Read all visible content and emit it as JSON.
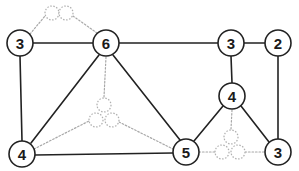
{
  "diagram": {
    "width": 299,
    "height": 171,
    "background_color": "#ffffff",
    "node_stroke_color": "#222222",
    "node_fill_color": "#ffffff",
    "label_color": "#1a1a1a",
    "solid_edge_color": "#222222",
    "dotted_edge_color": "#a8a8a8",
    "token_stroke_color": "#b0b0b0",
    "node_radius": 13,
    "token_radius": 7
  },
  "nodes": [
    {
      "id": "n-tl-3",
      "label": "3",
      "x": 20,
      "y": 43,
      "r": 13
    },
    {
      "id": "n-top-6",
      "label": "6",
      "x": 106,
      "y": 43,
      "r": 13
    },
    {
      "id": "n-tr-3",
      "label": "3",
      "x": 231,
      "y": 43,
      "r": 13
    },
    {
      "id": "n-tr-2",
      "label": "2",
      "x": 278,
      "y": 43,
      "r": 13
    },
    {
      "id": "n-mid-4",
      "label": "4",
      "x": 232,
      "y": 96,
      "r": 13
    },
    {
      "id": "n-bl-4",
      "label": "4",
      "x": 22,
      "y": 154,
      "r": 13
    },
    {
      "id": "n-bm-5",
      "label": "5",
      "x": 186,
      "y": 152,
      "r": 13
    },
    {
      "id": "n-br-3",
      "label": "3",
      "x": 278,
      "y": 152,
      "r": 13
    }
  ],
  "solid_edges": [
    {
      "name": "edge-3-6",
      "x1": 33,
      "y1": 43,
      "x2": 93,
      "y2": 43
    },
    {
      "name": "edge-6-3right",
      "x1": 119,
      "y1": 43,
      "x2": 218,
      "y2": 43
    },
    {
      "name": "edge-3right-2",
      "x1": 244,
      "y1": 43,
      "x2": 265,
      "y2": 43
    },
    {
      "name": "edge-3left-4left",
      "x1": 20,
      "y1": 56,
      "x2": 22,
      "y2": 141
    },
    {
      "name": "edge-2-3bottom",
      "x1": 278,
      "y1": 56,
      "x2": 278,
      "y2": 139
    },
    {
      "name": "edge-3right-4mid",
      "x1": 231,
      "y1": 56,
      "x2": 232,
      "y2": 83
    },
    {
      "name": "edge-6-4left",
      "x1": 99,
      "y1": 55,
      "x2": 31,
      "y2": 143
    },
    {
      "name": "edge-6-5",
      "x1": 113,
      "y1": 55,
      "x2": 180,
      "y2": 140
    },
    {
      "name": "edge-4left-5",
      "x1": 35,
      "y1": 155,
      "x2": 173,
      "y2": 153
    },
    {
      "name": "edge-4mid-5",
      "x1": 223,
      "y1": 106,
      "x2": 194,
      "y2": 141
    },
    {
      "name": "edge-4mid-3bottom",
      "x1": 241,
      "y1": 106,
      "x2": 269,
      "y2": 142
    }
  ],
  "dotted_edges": [
    {
      "name": "dotted-3left-token-a",
      "x1": 30,
      "y1": 34,
      "x2": 45,
      "y2": 16
    },
    {
      "name": "dotted-token-a-token-b",
      "x1": 59,
      "y1": 13,
      "x2": 59,
      "y2": 13
    },
    {
      "name": "dotted-token-b-6",
      "x1": 73,
      "y1": 16,
      "x2": 97,
      "y2": 33
    },
    {
      "name": "dotted-6-token-c",
      "x1": 106,
      "y1": 57,
      "x2": 104,
      "y2": 97
    },
    {
      "name": "dotted-4left-token-d",
      "x1": 34,
      "y1": 149,
      "x2": 89,
      "y2": 121
    },
    {
      "name": "dotted-token-e-5",
      "x1": 119,
      "y1": 122,
      "x2": 173,
      "y2": 149
    },
    {
      "name": "dotted-4mid-token-f",
      "x1": 232,
      "y1": 110,
      "x2": 231,
      "y2": 129
    },
    {
      "name": "dotted-5-token-g",
      "x1": 199,
      "y1": 152,
      "x2": 215,
      "y2": 152
    },
    {
      "name": "dotted-token-h-3bottom",
      "x1": 245,
      "y1": 152,
      "x2": 265,
      "y2": 152
    }
  ],
  "tokens": [
    {
      "name": "token-top-left-a",
      "x": 52,
      "y": 13,
      "r": 7
    },
    {
      "name": "token-top-left-b",
      "x": 66,
      "y": 13,
      "r": 7
    },
    {
      "name": "token-center-top",
      "x": 104,
      "y": 105,
      "r": 7
    },
    {
      "name": "token-center-left",
      "x": 96,
      "y": 120,
      "r": 7
    },
    {
      "name": "token-center-right",
      "x": 112,
      "y": 120,
      "r": 7
    },
    {
      "name": "token-right-top",
      "x": 231,
      "y": 137,
      "r": 7
    },
    {
      "name": "token-right-left",
      "x": 222,
      "y": 152,
      "r": 7
    },
    {
      "name": "token-right-right",
      "x": 238,
      "y": 152,
      "r": 7
    }
  ]
}
